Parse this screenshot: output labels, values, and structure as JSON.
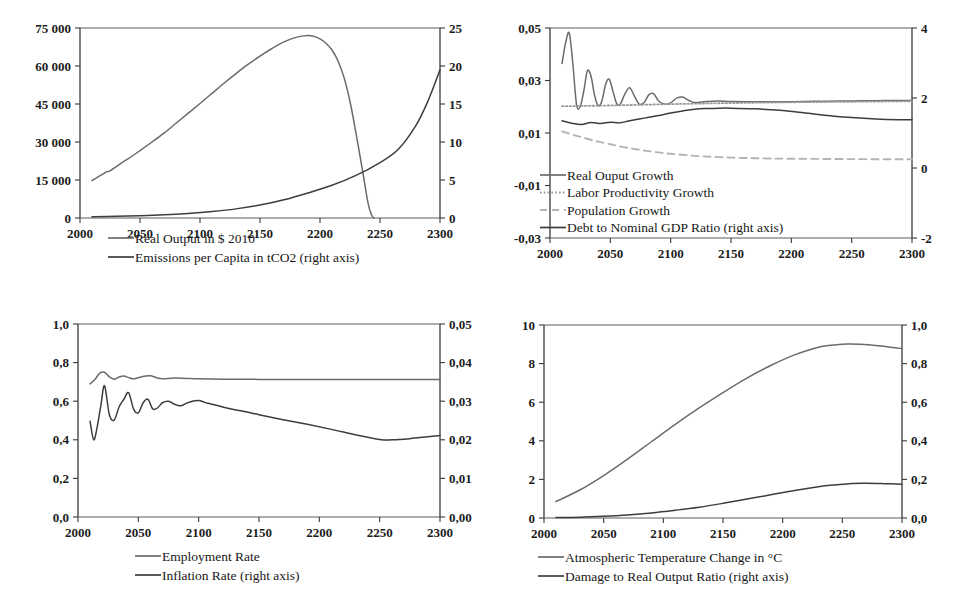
{
  "figure": {
    "panel_count": 4,
    "background_color": "#ffffff",
    "line_color_primary": "#6b6b6b",
    "line_color_secondary": "#3d3d3d",
    "axis_color": "#3a3a3a"
  },
  "chart_data": [
    {
      "id": "output-emissions",
      "position": "top-left",
      "type": "line",
      "title": "",
      "xlabel": "",
      "ylabel": "",
      "xlim": [
        2000,
        2300
      ],
      "xticks": [
        2000,
        2050,
        2100,
        2150,
        2200,
        2250,
        2300
      ],
      "xticklabels": [
        "2000",
        "2050",
        "2100",
        "2150",
        "2200",
        "2250",
        "2300"
      ],
      "ylim": [
        0,
        75000
      ],
      "yticks": [
        0,
        15000,
        30000,
        45000,
        60000,
        75000
      ],
      "yticklabels": [
        "0",
        "15 000",
        "30 000",
        "45 000",
        "60 000",
        "75 000"
      ],
      "ylim_right": [
        0,
        25
      ],
      "yticks_right": [
        0,
        5,
        10,
        15,
        20,
        25
      ],
      "yticklabels_right": [
        "0",
        "5",
        "10",
        "15",
        "20",
        "25"
      ],
      "grid": false,
      "legend_position": "below",
      "series": [
        {
          "name": "Real Output in $ 2010",
          "axis": "left",
          "style": "solid",
          "color": "#6b6b6b",
          "x": [
            2010,
            2015,
            2020,
            2022,
            2025,
            2030,
            2035,
            2040,
            2050,
            2060,
            2070,
            2080,
            2090,
            2100,
            2110,
            2120,
            2130,
            2140,
            2150,
            2160,
            2170,
            2180,
            2190,
            2195,
            2200,
            2205,
            2210,
            2215,
            2220,
            2225,
            2230,
            2235,
            2240,
            2243,
            2245
          ],
          "y": [
            14800,
            16200,
            17600,
            18200,
            18600,
            20200,
            21900,
            23300,
            26600,
            30000,
            33500,
            37400,
            41300,
            45200,
            49200,
            53200,
            57000,
            60600,
            63900,
            66900,
            69500,
            71300,
            72000,
            71700,
            70700,
            69000,
            66300,
            62000,
            55500,
            46000,
            33500,
            20000,
            6000,
            1200,
            0
          ]
        },
        {
          "name": "Emissions per Capita in tCO2 (right axis)",
          "axis": "right",
          "style": "solid",
          "color": "#3d3d3d",
          "x": [
            2010,
            2030,
            2050,
            2070,
            2090,
            2110,
            2130,
            2150,
            2170,
            2190,
            2210,
            2230,
            2250,
            2265,
            2280,
            2290,
            2300
          ],
          "y": [
            0.18,
            0.22,
            0.3,
            0.42,
            0.6,
            0.85,
            1.2,
            1.7,
            2.4,
            3.3,
            4.3,
            5.6,
            7.3,
            9.0,
            12.2,
            15.4,
            19.5
          ]
        }
      ]
    },
    {
      "id": "growth-debt",
      "position": "top-right",
      "type": "line",
      "title": "",
      "xlabel": "",
      "ylabel": "",
      "xlim": [
        2000,
        2300
      ],
      "xticks": [
        2000,
        2050,
        2100,
        2150,
        2200,
        2250,
        2300
      ],
      "xticklabels": [
        "2000",
        "2050",
        "2100",
        "2150",
        "2200",
        "2250",
        "2300"
      ],
      "ylim": [
        -0.03,
        0.05
      ],
      "yticks": [
        -0.03,
        -0.01,
        0.01,
        0.03,
        0.05
      ],
      "yticklabels": [
        "-0,03",
        "-0,01",
        "0,01",
        "0,03",
        "0,05"
      ],
      "ylim_right": [
        -2,
        4
      ],
      "yticks_right": [
        -2,
        0,
        2,
        4
      ],
      "yticklabels_right": [
        "-2",
        "0",
        "2",
        "4"
      ],
      "grid": false,
      "legend_position": "inside-lower-left",
      "series": [
        {
          "name": "Real Ouput Growth",
          "axis": "left",
          "style": "solid",
          "color": "#6b6b6b",
          "x": [
            2010,
            2013,
            2016,
            2019,
            2022,
            2025,
            2028,
            2031,
            2034,
            2037,
            2040,
            2043,
            2046,
            2049,
            2052,
            2055,
            2058,
            2062,
            2066,
            2070,
            2074,
            2078,
            2082,
            2086,
            2090,
            2095,
            2100,
            2105,
            2110,
            2115,
            2120,
            2130,
            2140,
            2150,
            2170,
            2190,
            2210,
            2230,
            2250,
            2270,
            2290,
            2300
          ],
          "y": [
            0.0365,
            0.0445,
            0.048,
            0.036,
            0.0208,
            0.02,
            0.026,
            0.0337,
            0.0316,
            0.0242,
            0.0204,
            0.0222,
            0.0284,
            0.0305,
            0.0262,
            0.0215,
            0.0208,
            0.0248,
            0.0272,
            0.024,
            0.021,
            0.0216,
            0.0246,
            0.0249,
            0.0222,
            0.021,
            0.0215,
            0.0233,
            0.0237,
            0.0224,
            0.0216,
            0.022,
            0.0222,
            0.022,
            0.0219,
            0.0219,
            0.022,
            0.0221,
            0.0222,
            0.0223,
            0.0224,
            0.0224
          ]
        },
        {
          "name": "Labor Productivity Growth",
          "axis": "left",
          "style": "dotted",
          "color": "#9a9a9a",
          "x": [
            2010,
            2050,
            2100,
            2150,
            2200,
            2250,
            2300
          ],
          "y": [
            0.0202,
            0.0205,
            0.021,
            0.0214,
            0.0217,
            0.0219,
            0.0221
          ]
        },
        {
          "name": "Population Growth",
          "axis": "left",
          "style": "dashed",
          "color": "#b4b4b4",
          "x": [
            2010,
            2020,
            2030,
            2040,
            2050,
            2060,
            2070,
            2080,
            2090,
            2100,
            2120,
            2140,
            2160,
            2180,
            2200,
            2250,
            2300
          ],
          "y": [
            0.0106,
            0.0092,
            0.0079,
            0.0067,
            0.0057,
            0.0047,
            0.0039,
            0.0032,
            0.0026,
            0.0021,
            0.0013,
            0.0008,
            0.0005,
            0.0003,
            0.0002,
            5e-05,
            0.0
          ]
        },
        {
          "name": "Debt to Nominal GDP Ratio (right axis)",
          "axis": "right",
          "style": "solid",
          "color": "#3d3d3d",
          "x": [
            2010,
            2018,
            2026,
            2034,
            2042,
            2050,
            2058,
            2066,
            2074,
            2082,
            2090,
            2100,
            2110,
            2120,
            2130,
            2140,
            2150,
            2170,
            2190,
            2210,
            2230,
            2250,
            2270,
            2290,
            2300
          ],
          "y": [
            1.35,
            1.28,
            1.24,
            1.3,
            1.27,
            1.31,
            1.29,
            1.35,
            1.4,
            1.45,
            1.5,
            1.57,
            1.63,
            1.68,
            1.7,
            1.71,
            1.71,
            1.69,
            1.65,
            1.58,
            1.5,
            1.44,
            1.4,
            1.38,
            1.38
          ]
        }
      ]
    },
    {
      "id": "employment-inflation",
      "position": "bottom-left",
      "type": "line",
      "title": "",
      "xlabel": "",
      "ylabel": "",
      "xlim": [
        2000,
        2300
      ],
      "xticks": [
        2000,
        2050,
        2100,
        2150,
        2200,
        2250,
        2300
      ],
      "xticklabels": [
        "2000",
        "2050",
        "2100",
        "2150",
        "2200",
        "2250",
        "2300"
      ],
      "ylim": [
        0.0,
        1.0
      ],
      "yticks": [
        0.0,
        0.2,
        0.4,
        0.6,
        0.8,
        1.0
      ],
      "yticklabels": [
        "0,0",
        "0,2",
        "0,4",
        "0,6",
        "0,8",
        "1,0"
      ],
      "ylim_right": [
        0.0,
        0.05
      ],
      "yticks_right": [
        0.0,
        0.01,
        0.02,
        0.03,
        0.04,
        0.05
      ],
      "yticklabels_right": [
        "0,00",
        "0,01",
        "0,02",
        "0,03",
        "0,04",
        "0,05"
      ],
      "grid": false,
      "legend_position": "below",
      "series": [
        {
          "name": "Employment Rate",
          "axis": "left",
          "style": "solid",
          "color": "#6b6b6b",
          "x": [
            2010,
            2014,
            2018,
            2022,
            2026,
            2030,
            2034,
            2038,
            2042,
            2046,
            2050,
            2055,
            2060,
            2065,
            2070,
            2080,
            2090,
            2100,
            2120,
            2150,
            2200,
            2250,
            2300
          ],
          "y": [
            0.69,
            0.712,
            0.745,
            0.75,
            0.726,
            0.714,
            0.725,
            0.731,
            0.722,
            0.716,
            0.722,
            0.729,
            0.732,
            0.722,
            0.716,
            0.72,
            0.718,
            0.716,
            0.714,
            0.713,
            0.712,
            0.712,
            0.712
          ]
        },
        {
          "name": "Inflation Rate (right axis)",
          "axis": "right",
          "style": "solid",
          "color": "#3d3d3d",
          "x": [
            2010,
            2013,
            2016,
            2019,
            2022,
            2026,
            2030,
            2034,
            2038,
            2042,
            2046,
            2050,
            2054,
            2058,
            2062,
            2066,
            2070,
            2075,
            2080,
            2085,
            2090,
            2095,
            2100,
            2105,
            2110,
            2120,
            2130,
            2140,
            2150,
            2170,
            2190,
            2210,
            2230,
            2250,
            2260,
            2275,
            2290,
            2300
          ],
          "y": [
            0.0248,
            0.02,
            0.0235,
            0.029,
            0.034,
            0.0265,
            0.0251,
            0.0285,
            0.0305,
            0.0322,
            0.028,
            0.027,
            0.0296,
            0.0305,
            0.028,
            0.0283,
            0.0296,
            0.03,
            0.0292,
            0.0288,
            0.0295,
            0.03,
            0.0302,
            0.0297,
            0.0293,
            0.0285,
            0.0278,
            0.0272,
            0.0265,
            0.0252,
            0.024,
            0.0227,
            0.0213,
            0.0201,
            0.02,
            0.0203,
            0.0208,
            0.0211
          ]
        }
      ]
    },
    {
      "id": "temperature-damage",
      "position": "bottom-right",
      "type": "line",
      "title": "",
      "xlabel": "",
      "ylabel": "",
      "xlim": [
        2000,
        2300
      ],
      "xticks": [
        2000,
        2050,
        2100,
        2150,
        2200,
        2250,
        2300
      ],
      "xticklabels": [
        "2000",
        "2050",
        "2100",
        "2150",
        "2200",
        "2250",
        "2300"
      ],
      "ylim": [
        0,
        10
      ],
      "yticks": [
        0,
        2,
        4,
        6,
        8,
        10
      ],
      "yticklabels": [
        "0",
        "2",
        "4",
        "6",
        "8",
        "10"
      ],
      "ylim_right": [
        0.0,
        1.0
      ],
      "yticks_right": [
        0.0,
        0.2,
        0.4,
        0.6,
        0.8,
        1.0
      ],
      "yticklabels_right": [
        "0,0",
        "0,2",
        "0,4",
        "0,6",
        "0,8",
        "1,0"
      ],
      "grid": false,
      "legend_position": "below",
      "series": [
        {
          "name": "Atmospheric Temperature Change in °C",
          "axis": "left",
          "style": "solid",
          "color": "#6b6b6b",
          "x": [
            2010,
            2030,
            2050,
            2070,
            2090,
            2110,
            2130,
            2150,
            2170,
            2190,
            2210,
            2230,
            2245,
            2255,
            2265,
            2280,
            2300
          ],
          "y": [
            0.85,
            1.45,
            2.2,
            3.05,
            3.95,
            4.85,
            5.7,
            6.5,
            7.25,
            7.9,
            8.45,
            8.85,
            8.98,
            9.02,
            9.0,
            8.92,
            8.78
          ]
        },
        {
          "name": "Damage to Real Output Ratio  (right axis)",
          "axis": "right",
          "style": "solid",
          "color": "#3d3d3d",
          "x": [
            2010,
            2030,
            2050,
            2070,
            2090,
            2110,
            2130,
            2150,
            2170,
            2190,
            2210,
            2230,
            2245,
            2258,
            2270,
            2285,
            2300
          ],
          "y": [
            0.002,
            0.004,
            0.009,
            0.016,
            0.026,
            0.04,
            0.056,
            0.076,
            0.098,
            0.12,
            0.143,
            0.162,
            0.172,
            0.179,
            0.18,
            0.178,
            0.175
          ]
        }
      ]
    }
  ]
}
